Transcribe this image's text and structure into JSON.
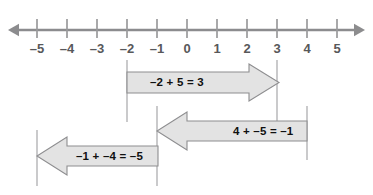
{
  "figure": {
    "title_visible": false,
    "background_color": "#ffffff",
    "axis_color": "#8c8c8e",
    "tick_color": "#9a9a9c",
    "guide_color": "#b4b4b6",
    "arrow_fill": "#e3e3e3",
    "arrow_stroke": "#8e8e90",
    "label_color": "#58585a",
    "equation_color": "#101010"
  },
  "number_line": {
    "name": "integer-number-line",
    "min": -5,
    "max": 5,
    "pixels_per_unit": 30,
    "origin_x": 187,
    "axis_y": 30,
    "left_arrowhead": true,
    "right_arrowhead": true,
    "ticks": [
      {
        "value": -5,
        "label": "–5",
        "x": 37
      },
      {
        "value": -4,
        "label": "–4",
        "x": 67
      },
      {
        "value": -3,
        "label": "–3",
        "x": 97
      },
      {
        "value": -2,
        "label": "–2",
        "x": 127
      },
      {
        "value": -1,
        "label": "–1",
        "x": 157
      },
      {
        "value": 0,
        "label": "0",
        "x": 187
      },
      {
        "value": 1,
        "label": "1",
        "x": 217
      },
      {
        "value": 2,
        "label": "2",
        "x": 247
      },
      {
        "value": 3,
        "label": "3",
        "x": 277
      },
      {
        "value": 4,
        "label": "4",
        "x": 307
      },
      {
        "value": 5,
        "label": "5",
        "x": 337
      }
    ]
  },
  "arrows": [
    {
      "id": "arrow-minus2-plus5",
      "equation": "–2 + 5 = 3",
      "start_value": -2,
      "end_value": 3,
      "direction": "right",
      "start_x": 127,
      "end_x": 279,
      "body_top": 72,
      "body_bottom": 93,
      "head_top": 64,
      "head_bottom": 101,
      "head_length": 30,
      "label_x": 150,
      "label_y": 76
    },
    {
      "id": "arrow-4-plus-minus5",
      "equation": "4 + –5 = –1",
      "start_value": 4,
      "end_value": -1,
      "direction": "left",
      "start_x": 307,
      "end_x": 157,
      "body_top": 121,
      "body_bottom": 141,
      "head_top": 112,
      "head_bottom": 150,
      "head_length": 30,
      "label_x": 233,
      "label_y": 125,
      "overflow_right": true
    },
    {
      "id": "arrow-minus1-plus-minus4",
      "equation": "–1 + –4 = –5",
      "start_value": -1,
      "end_value": -5,
      "direction": "left",
      "start_x": 158,
      "end_x": 37,
      "body_top": 146,
      "body_bottom": 166,
      "head_top": 137,
      "head_bottom": 175,
      "head_length": 30,
      "label_x": 76,
      "label_y": 150
    }
  ],
  "guide_lines": [
    {
      "name": "guide-minus2",
      "value": -2,
      "x": 127,
      "y_top": 60,
      "y_bottom": 122
    },
    {
      "name": "guide-3",
      "value": 3,
      "x": 277,
      "y_top": 60,
      "y_bottom": 122
    },
    {
      "name": "guide-minus1",
      "value": -1,
      "x": 157,
      "y_top": 106,
      "y_bottom": 186
    },
    {
      "name": "guide-4",
      "value": 4,
      "x": 307,
      "y_top": 106,
      "y_bottom": 160
    },
    {
      "name": "guide-minus5",
      "value": -5,
      "x": 37,
      "y_top": 130,
      "y_bottom": 186
    }
  ]
}
